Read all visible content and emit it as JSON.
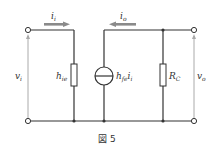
{
  "figure": {
    "caption": "図 5",
    "type": "small-signal equivalent circuit (h-parameter, common emitter)"
  },
  "labels": {
    "input_current": "i",
    "input_current_sub": "i",
    "output_current": "i",
    "output_current_sub": "o",
    "input_voltage": "v",
    "input_voltage_sub": "i",
    "output_voltage": "v",
    "output_voltage_sub": "o",
    "hie": "h",
    "hie_sub": "ie",
    "source": "h",
    "source_sub": "fe",
    "source_current": "i",
    "source_current_sub": "i",
    "rc": "R",
    "rc_sub": "C"
  },
  "components": [
    {
      "name": "h_ie",
      "kind": "resistor"
    },
    {
      "name": "h_fe i_i",
      "kind": "current-source"
    },
    {
      "name": "R_C",
      "kind": "resistor"
    }
  ],
  "colors": {
    "wire": "#333333",
    "arrow": "#8a8a8a",
    "voltage_arrow": "#aaaaaa"
  }
}
